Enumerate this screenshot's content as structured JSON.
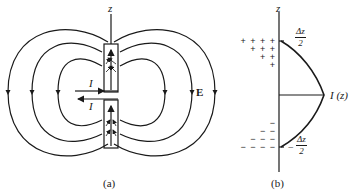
{
  "figure": {
    "panel_a": {
      "caption": "(a)",
      "axis_label": "z",
      "current_top_label": "I",
      "current_bottom_label": "I",
      "field_label": "E",
      "field_lines": 3
    },
    "panel_b": {
      "caption": "(b)",
      "axis_label": "z",
      "top_label": {
        "num": "Δz",
        "den": "2",
        "sign": ""
      },
      "bottom_label": {
        "num": "Δz",
        "den": "2",
        "sign": "−"
      },
      "curve_label": "I (z)",
      "plus_rows": [
        "+ + + +",
        "+ + +",
        "+ +",
        "+"
      ],
      "minus_rows": [
        "−",
        "− −",
        "− − −",
        "− − − −"
      ]
    }
  }
}
